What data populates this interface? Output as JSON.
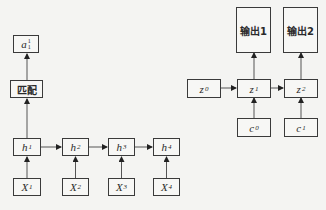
{
  "left_diagram": {
    "output": {
      "base": "a",
      "sup": "1",
      "sub": "1"
    },
    "match_label": "匹配",
    "hidden": [
      {
        "base": "h",
        "sup": "1"
      },
      {
        "base": "h",
        "sup": "2"
      },
      {
        "base": "h",
        "sup": "3"
      },
      {
        "base": "h",
        "sup": "4"
      }
    ],
    "inputs": [
      {
        "base": "X",
        "sub": "1"
      },
      {
        "base": "X",
        "sub": "2"
      },
      {
        "base": "X",
        "sub": "3"
      },
      {
        "base": "X",
        "sub": "4"
      }
    ]
  },
  "right_diagram": {
    "outputs": [
      {
        "label": "输出1"
      },
      {
        "label": "输出2"
      }
    ],
    "states": [
      {
        "base": "z",
        "sup": "0"
      },
      {
        "base": "z",
        "sup": "1"
      },
      {
        "base": "z",
        "sup": "2"
      }
    ],
    "contexts": [
      {
        "base": "c",
        "sup": "0"
      },
      {
        "base": "c",
        "sup": "1"
      }
    ]
  }
}
